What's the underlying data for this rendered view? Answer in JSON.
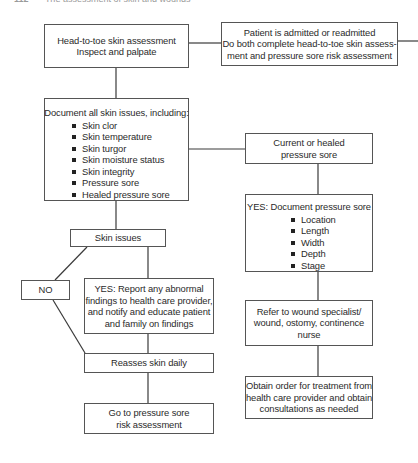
{
  "header": {
    "page_number": "112",
    "running_title": "The assessment of skin and wounds"
  },
  "flowchart": {
    "head_to_toe": {
      "lines": [
        "Head-to-toe skin assessment",
        "Inspect and palpate"
      ]
    },
    "patient_admitted": {
      "lines": [
        "Patient is admitted or readmitted",
        "Do both complete head-to-toe skin assess-",
        "ment and pressure sore risk assessment"
      ]
    },
    "document_issues": {
      "title": "Document all skin issues, including:",
      "items": [
        "Skin clor",
        "Skin temperature",
        "Skin turgor",
        "Skin moisture status",
        "Skin integrity",
        "Pressure sore",
        "Healed pressure sore"
      ]
    },
    "current_or_healed": {
      "lines": [
        "Current or healed",
        "pressure sore"
      ]
    },
    "yes_document": {
      "title": "YES: Document pressure sore",
      "items": [
        "Location",
        "Length",
        "Width",
        "Depth",
        "Stage"
      ]
    },
    "skin_issues": {
      "lines": [
        "Skin issues"
      ]
    },
    "no": {
      "lines": [
        "NO"
      ]
    },
    "yes_report": {
      "lines": [
        "YES: Report any abnormal",
        "findings to health care provider,",
        "and notify and educate patient",
        "and family on findings"
      ]
    },
    "refer": {
      "lines": [
        "Refer to wound specialist/",
        "wound, ostomy, continence",
        "nurse"
      ]
    },
    "reasses": {
      "lines": [
        "Reasses skin daily"
      ]
    },
    "obtain_order": {
      "lines": [
        "Obtain order for treatment from",
        "health care provider and obtain",
        "consultations as needed"
      ]
    },
    "go_to": {
      "lines": [
        "Go to pressure sore",
        "risk assessment"
      ]
    }
  }
}
